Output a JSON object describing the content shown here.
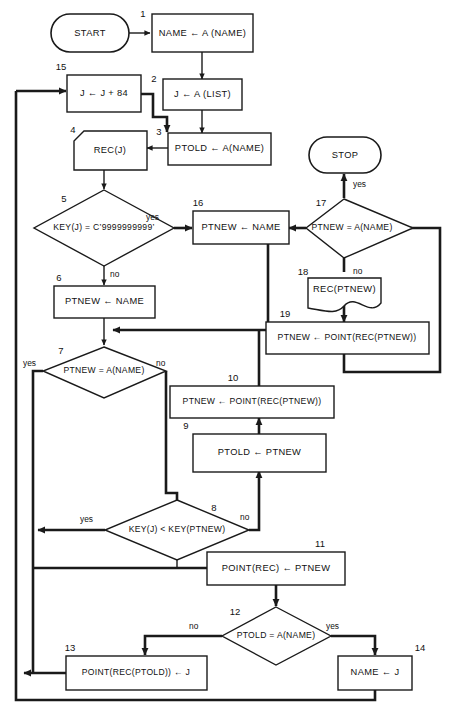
{
  "diagram": {
    "colors": {
      "stroke": "#1a1a1a",
      "fill": "#ffffff",
      "background": "#ffffff"
    },
    "terminals": [
      {
        "id": "start",
        "label": "START"
      },
      {
        "id": "stop",
        "label": "STOP"
      }
    ],
    "nodes": [
      {
        "num": "1",
        "shape": "process",
        "text": "NAME ← A (NAME)"
      },
      {
        "num": "2",
        "shape": "process",
        "text": "J ← A (LIST)"
      },
      {
        "num": "3",
        "shape": "process",
        "text": "PTOLD ← A(NAME)"
      },
      {
        "num": "4",
        "shape": "chamfer",
        "text": "REC(J)"
      },
      {
        "num": "5",
        "shape": "decision",
        "text": "KEY(J) = C’9999999999’"
      },
      {
        "num": "6",
        "shape": "process",
        "text": "PTNEW ← NAME"
      },
      {
        "num": "7",
        "shape": "decision",
        "text": "PTNEW = A(NAME)"
      },
      {
        "num": "8",
        "shape": "decision",
        "text": "KEY(J) < KEY(PTNEW)"
      },
      {
        "num": "9",
        "shape": "process",
        "text": "PTOLD ← PTNEW"
      },
      {
        "num": "10",
        "shape": "process",
        "text": "PTNEW ← POINT(REC(PTNEW))"
      },
      {
        "num": "11",
        "shape": "process",
        "text": "POINT(REC) ← PTNEW"
      },
      {
        "num": "12",
        "shape": "decision",
        "text": "PTOLD = A(NAME)"
      },
      {
        "num": "13",
        "shape": "process",
        "text": "POINT(REC(PTOLD)) ← J"
      },
      {
        "num": "14",
        "shape": "process",
        "text": "NAME ← J"
      },
      {
        "num": "15",
        "shape": "process",
        "text": "J ← J + 84"
      },
      {
        "num": "16",
        "shape": "process",
        "text": "PTNEW ← NAME"
      },
      {
        "num": "17",
        "shape": "decision",
        "text": "PTNEW = A(NAME)"
      },
      {
        "num": "18",
        "shape": "document",
        "text": "REC(PTNEW)"
      },
      {
        "num": "19",
        "shape": "process",
        "text": "PTNEW ← POINT(REC(PTNEW))"
      }
    ],
    "branch_labels": {
      "n5_yes": "yes",
      "n5_no": "no",
      "n7_yes": "yes",
      "n7_no": "no",
      "n8_yes": "yes",
      "n8_no": "no",
      "n12_no": "no",
      "n12_yes": "yes",
      "n17_yes": "yes",
      "n17_no": "no"
    }
  }
}
